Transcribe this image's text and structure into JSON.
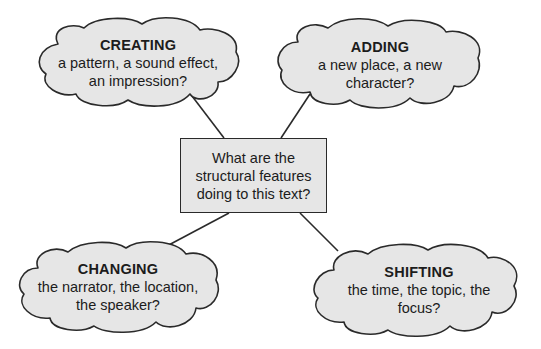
{
  "diagram": {
    "type": "mind-map",
    "colors": {
      "background": "#ffffff",
      "node_fill": "#e6e6e6",
      "stroke": "#2a2a2a",
      "text": "#1c1c1c"
    },
    "center": {
      "text": "What are the structural features doing to this text?"
    },
    "nodes": [
      {
        "id": "creating",
        "title": "CREATING",
        "body": "a pattern, a sound effect, an impression?",
        "position": "top-left"
      },
      {
        "id": "adding",
        "title": "ADDING",
        "body": "a new place, a new character?",
        "position": "top-right"
      },
      {
        "id": "changing",
        "title": "CHANGING",
        "body": "the narrator, the location, the speaker?",
        "position": "bottom-left"
      },
      {
        "id": "shifting",
        "title": "SHIFTING",
        "body": "the time, the topic, the focus?",
        "position": "bottom-right"
      }
    ],
    "edges": [
      {
        "from": "center",
        "to": "creating"
      },
      {
        "from": "center",
        "to": "adding"
      },
      {
        "from": "center",
        "to": "changing"
      },
      {
        "from": "center",
        "to": "shifting"
      }
    ]
  }
}
